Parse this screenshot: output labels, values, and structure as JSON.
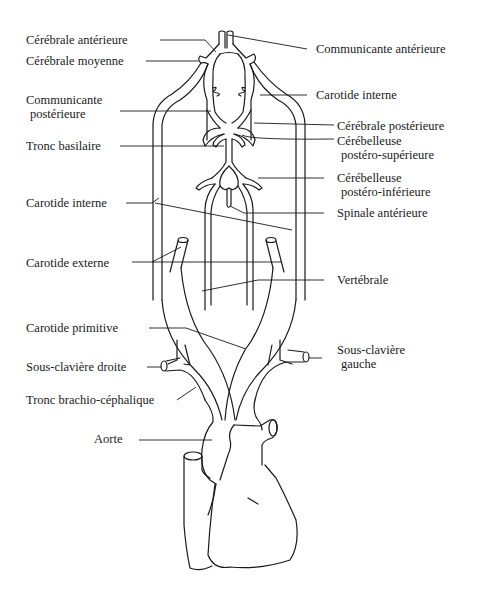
{
  "diagram": {
    "labels_left": {
      "cerebrale_anterieure": "Cérébrale antérieure",
      "cerebrale_moyenne": "Cérébrale moyenne",
      "communicante_posterieure_1": "Communicante",
      "communicante_posterieure_2": "postérieure",
      "tronc_basilaire": "Tronc basilaire",
      "carotide_interne": "Carotide interne",
      "carotide_externe": "Carotide externe",
      "carotide_primitive": "Carotide primitive",
      "sous_claviere_droite": "Sous-clavière droite",
      "tronc_brachio_cephalique": "Tronc brachio-céphalique",
      "aorte": "Aorte"
    },
    "labels_right": {
      "communicante_anterieure": "Communicante antérieure",
      "carotide_interne": "Carotide interne",
      "cerebrale_posterieure": "Cérébrale postérieure",
      "cerebelleuse_ps_1": "Cérébelleuse",
      "cerebelleuse_ps_2": "postéro-supérieure",
      "cerebelleuse_pi_1": "Cérébelleuse",
      "cerebelleuse_pi_2": "postéro-inférieure",
      "spinale_anterieure": "Spinale antérieure",
      "vertebrale": "Vertébrale",
      "sous_claviere_gauche_1": "Sous-clavière",
      "sous_claviere_gauche_2": "gauche"
    },
    "colors": {
      "line": "#1a1a1a",
      "background": "#ffffff"
    }
  }
}
